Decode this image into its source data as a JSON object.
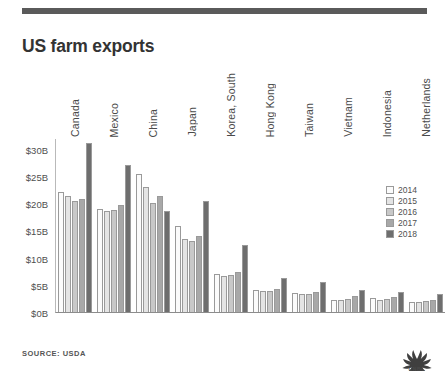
{
  "header": {
    "title": "US farm exports",
    "rule_color": "#5a5a5a"
  },
  "footer": {
    "source": "SOURCE: USDA",
    "logo_name": "CNBC",
    "logo_wordmark": "CNBC"
  },
  "legend": {
    "position": "right",
    "entries": [
      {
        "label": "2014",
        "color": "#fbfbfb"
      },
      {
        "label": "2015",
        "color": "#e4e4e4"
      },
      {
        "label": "2016",
        "color": "#c8c8c8"
      },
      {
        "label": "2017",
        "color": "#a8a8a8"
      },
      {
        "label": "2018",
        "color": "#6e6e6e"
      }
    ]
  },
  "chart_data": {
    "type": "bar",
    "title": "US farm exports",
    "subtitle": "",
    "xlabel": "",
    "ylabel": "Annual trade volume (USD)",
    "ylim": [
      0,
      32
    ],
    "yticks": [
      0,
      5,
      10,
      15,
      20,
      25,
      30
    ],
    "ytick_labels": [
      "$0B",
      "$5B",
      "$10B",
      "$15B",
      "$20B",
      "$25B",
      "$30B"
    ],
    "y_unit": "billions of USD",
    "grid": false,
    "legend_position": "right",
    "categories": [
      "Canada",
      "Mexico",
      "China",
      "Japan",
      "Korea, South",
      "Hong Kong",
      "Taiwan",
      "Vietnam",
      "Indonesia",
      "Netherlands"
    ],
    "series": [
      {
        "name": "2014",
        "color": "#fbfbfb",
        "values": [
          22.0,
          19.0,
          25.3,
          15.8,
          6.9,
          4.1,
          3.5,
          2.2,
          2.5,
          1.9
        ]
      },
      {
        "name": "2015",
        "color": "#e4e4e4",
        "values": [
          21.3,
          18.5,
          23.0,
          13.5,
          6.7,
          3.9,
          3.3,
          2.3,
          2.3,
          1.8
        ]
      },
      {
        "name": "2016",
        "color": "#c8c8c8",
        "values": [
          20.5,
          18.7,
          20.0,
          13.1,
          6.8,
          3.9,
          3.3,
          2.4,
          2.4,
          2.0
        ]
      },
      {
        "name": "2017",
        "color": "#a8a8a8",
        "values": [
          20.8,
          19.6,
          21.3,
          14.0,
          7.4,
          4.2,
          3.6,
          2.9,
          2.7,
          2.2
        ]
      },
      {
        "name": "2018",
        "color": "#6e6e6e",
        "values": [
          31.0,
          27.0,
          18.6,
          20.4,
          12.4,
          6.2,
          5.5,
          4.0,
          3.6,
          3.4
        ]
      }
    ]
  }
}
